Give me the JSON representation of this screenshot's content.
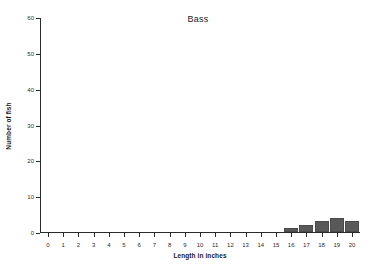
{
  "chart_data": {
    "type": "bar",
    "title": "Bass",
    "xlabel": "Length in inches",
    "ylabel": "Number of fish",
    "categories": [
      "0",
      "1",
      "2",
      "3",
      "4",
      "5",
      "6",
      "7",
      "8",
      "9",
      "10",
      "11",
      "12",
      "13",
      "14",
      "15",
      "16",
      "17",
      "18",
      "19",
      "20"
    ],
    "values": [
      0,
      0,
      0,
      0,
      0,
      0,
      0,
      0,
      0,
      0,
      0,
      0,
      0,
      0,
      0,
      0,
      1,
      2,
      3,
      4,
      3
    ],
    "xlim": [
      0,
      20
    ],
    "ylim": [
      0,
      60
    ],
    "yticks": [
      0,
      10,
      20,
      30,
      40,
      50,
      60
    ],
    "ytick_labels": [
      "0",
      "10",
      "20",
      "30",
      "40",
      "50",
      "60"
    ],
    "xticks": [
      0,
      1,
      2,
      3,
      4,
      5,
      6,
      7,
      8,
      9,
      10,
      11,
      12,
      13,
      14,
      15,
      16,
      17,
      18,
      19,
      20
    ],
    "xtick_labels": [
      "0",
      "1",
      "2",
      "3",
      "4",
      "5",
      "6",
      "7",
      "8",
      "9",
      "10",
      "11",
      "12",
      "13",
      "14",
      "15",
      "16",
      "17",
      "18",
      "19",
      "20"
    ],
    "grid": false,
    "legend": null,
    "bar_color": "#595959",
    "axis_color": "#2b2b2b",
    "background": "#ffffff"
  }
}
